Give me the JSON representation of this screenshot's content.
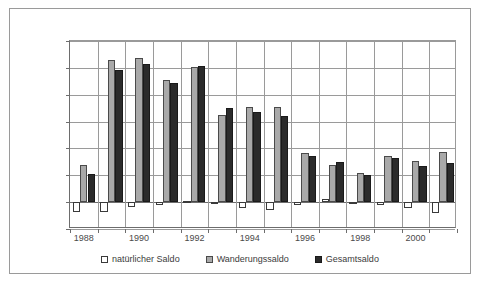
{
  "chart_data": {
    "type": "bar",
    "title": "",
    "subtitle": "",
    "xlabel": "",
    "ylabel": "",
    "ylim": [
      -20000,
      120000
    ],
    "ytick_step": 20000,
    "yticks": [
      120000,
      100000,
      80000,
      60000,
      40000,
      20000,
      0,
      -20000
    ],
    "ytick_labels": [
      "120.000",
      "100.000",
      "80.000",
      "60.000",
      "40.000",
      "20.000",
      "0",
      "-20.000"
    ],
    "categories": [
      "1988",
      "1989",
      "1990",
      "1991",
      "1992",
      "1993",
      "1994",
      "1995",
      "1996",
      "1997",
      "1998",
      "1999",
      "2000",
      "2001"
    ],
    "xtick_labels": [
      "1988",
      "",
      "1990",
      "",
      "1992",
      "",
      "1994",
      "",
      "1996",
      "",
      "1998",
      "",
      "2000",
      ""
    ],
    "grid": true,
    "legend_position": "bottom",
    "series": [
      {
        "name": "natürlicher Saldo",
        "color": "#ffffff",
        "values": [
          -7000,
          -7000,
          -3500,
          -2500,
          500,
          -1000,
          -4000,
          -6000,
          -2000,
          2000,
          -1500,
          -2500,
          -4000,
          -8000
        ]
      },
      {
        "name": "Wanderungssaldo",
        "color": "#a9a9a9",
        "values": [
          28000,
          105500,
          107000,
          91000,
          101000,
          65000,
          71000,
          70500,
          36500,
          28000,
          22000,
          34500,
          30500,
          37000
        ]
      },
      {
        "name": "Gesamtsaldo",
        "color": "#2b2b2b",
        "values": [
          21000,
          98500,
          103000,
          88500,
          101500,
          70000,
          67000,
          64500,
          34500,
          30000,
          20500,
          33000,
          27000,
          29500
        ]
      }
    ]
  },
  "legend": {
    "items": [
      {
        "label": "natürlicher Saldo"
      },
      {
        "label": "Wanderungssaldo"
      },
      {
        "label": "Gesamtsaldo"
      }
    ]
  }
}
